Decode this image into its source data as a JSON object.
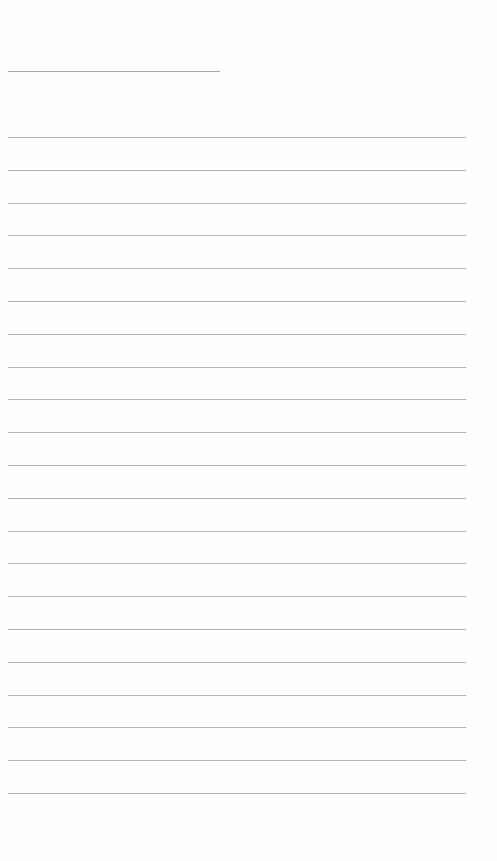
{
  "page": {
    "type": "lined-notepad",
    "background_color": "#fefefe",
    "line_color": "#b4b4b4",
    "header_line": {
      "top": 71,
      "left": 8,
      "width": 212
    },
    "ruled_lines": {
      "count": 21,
      "first_top": 137,
      "spacing": 32.8,
      "left": 8,
      "width": 458
    }
  }
}
